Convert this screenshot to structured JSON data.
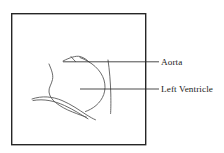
{
  "figure": {
    "caption_panel": {
      "frame": {
        "x": 11,
        "y": 13,
        "width": 135,
        "height": 132,
        "stroke_color": "#262626",
        "stroke_width": 1.4,
        "fill_color": "#ffffff"
      }
    },
    "background_color": "#ffffff",
    "line_color": "#555555",
    "label_color": "#1a1a1a"
  },
  "labels": [
    {
      "id": "aorta",
      "text": "Aorta",
      "x": 161,
      "y": 57,
      "leader_line": {
        "x1": 63,
        "y1": 62,
        "x2": 159,
        "y2": 62
      }
    },
    {
      "id": "left-ventricle",
      "text": "Left Ventricle",
      "x": 161,
      "y": 84,
      "leader_line": {
        "x1": 80,
        "y1": 89,
        "x2": 159,
        "y2": 89
      }
    }
  ],
  "anatomy_strokes": [
    {
      "name": "aortic-root-upper-wall",
      "d": "M 63 61 C 70 57.5 76 55.5 80 56.5 C 84.5 57.8 87 60 89 62"
    },
    {
      "name": "ventricle-right-free-wall",
      "d": "M 80 57.5 C 92 62 101 70 104 80 C 107 90.5 103 99.5 96 105.5 C 92.5 108.5 88.5 110.5 85.5 111.5"
    },
    {
      "name": "ventricle-left-septal-wall",
      "d": "M 49 64 C 51.5 70 53.5 74.5 52.5 79.5 C 51.5 84.5 48.5 87.5 49 92 C 49.4 96 52 99.5 55.5 102.5 C 60 106.2 66 109.5 72.5 112 C 78 114.2 83 116 86.5 117.2"
    },
    {
      "name": "ventricle-apex-lower-contour",
      "d": "M 32 99 C 42 95.5 52.5 96.5 62 100.5 C 71.5 104.5 79 110 86 114.5 C 90 117 93 118.8 95.5 119.8"
    },
    {
      "name": "mitral-inflow-inner-line",
      "d": "M 33 100.5 C 44 98.5 54.5 101 64.5 105.5 C 74 109.8 82 115.2 88 118.8"
    },
    {
      "name": "catheter-vertical-line",
      "d": "M 108 60 C 109.5 70 110.5 82 110.8 94 C 111 104 110.8 110 110.6 113.5"
    },
    {
      "name": "aortic-wall-short-segment",
      "d": "M 71 56.5 C 72.5 58.5 74 60 75.5 61.5"
    }
  ]
}
